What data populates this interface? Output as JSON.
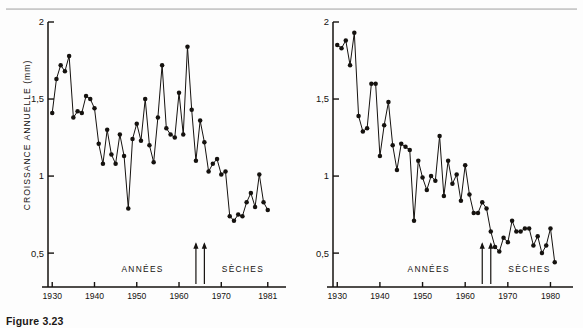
{
  "figure": {
    "caption": "Figure 3.23",
    "ylabel": "CROISSANCE ANNUELLE (mm)",
    "ink_color": "#15120f",
    "background": "#fdfdfd"
  },
  "chart_data": [
    {
      "type": "line",
      "panel": "left",
      "title": "",
      "xlabel": "",
      "ylabel": "CROISSANCE ANNUELLE (mm)",
      "xlim": [
        1929,
        1982
      ],
      "ylim": [
        0.28,
        2.0
      ],
      "grid": false,
      "legend": null,
      "ytick_values": [
        2,
        1.5,
        1,
        0.5
      ],
      "ytick_labels": [
        "2",
        "1,5",
        "1",
        "0,5"
      ],
      "xtick_values": [
        1930,
        1940,
        1950,
        1960,
        1970,
        1981
      ],
      "xtick_labels": [
        "19|30",
        "1940",
        "1950",
        "1960",
        "1970",
        "1981"
      ],
      "marker": "filled-circle",
      "annotations": [
        {
          "text": "ANNÉES",
          "x": 1958.5,
          "y": 0.4
        },
        {
          "text": "SÈCHES",
          "x": 1968.0,
          "y": 0.4
        },
        {
          "text": "arrow-up",
          "x": 1964.0,
          "y_from": 0.3,
          "y_to": 0.56
        },
        {
          "text": "arrow-up",
          "x": 1966.0,
          "y_from": 0.3,
          "y_to": 0.56
        }
      ],
      "x": [
        1930,
        1931,
        1932,
        1933,
        1934,
        1935,
        1936,
        1937,
        1938,
        1939,
        1940,
        1941,
        1942,
        1943,
        1944,
        1945,
        1946,
        1947,
        1948,
        1949,
        1950,
        1951,
        1952,
        1953,
        1954,
        1955,
        1956,
        1957,
        1958,
        1959,
        1960,
        1961,
        1962,
        1963,
        1964,
        1965,
        1966,
        1967,
        1968,
        1969,
        1970,
        1971,
        1972,
        1973,
        1974,
        1975,
        1976,
        1977,
        1978,
        1979,
        1980,
        1981
      ],
      "values": [
        1.41,
        1.63,
        1.72,
        1.68,
        1.78,
        1.38,
        1.42,
        1.41,
        1.52,
        1.5,
        1.44,
        1.21,
        1.08,
        1.3,
        1.14,
        1.08,
        1.27,
        1.13,
        0.79,
        1.24,
        1.34,
        1.23,
        1.5,
        1.2,
        1.09,
        1.38,
        1.72,
        1.31,
        1.27,
        1.25,
        1.54,
        1.27,
        1.84,
        1.43,
        1.1,
        1.36,
        1.22,
        1.03,
        1.08,
        1.11,
        1.01,
        1.03,
        0.74,
        0.71,
        0.75,
        0.74,
        0.83,
        0.89,
        0.8,
        1.01,
        0.83,
        0.78
      ]
    },
    {
      "type": "line",
      "panel": "right",
      "title": "",
      "xlabel": "",
      "ylabel": "",
      "xlim": [
        1929,
        1982
      ],
      "ylim": [
        0.28,
        2.0
      ],
      "grid": false,
      "legend": null,
      "ytick_values": [
        2,
        1.5,
        1,
        0.5
      ],
      "ytick_labels": [
        "2",
        "1,5",
        "1",
        "0,5"
      ],
      "xtick_values": [
        1930,
        1940,
        1950,
        1960,
        1970,
        1980
      ],
      "xtick_labels": [
        "19|30",
        "1940",
        "1950",
        "1960",
        "1970",
        "1980"
      ],
      "marker": "filled-circle",
      "annotations": [
        {
          "text": "ANNÉES",
          "x": 1958.5,
          "y": 0.4
        },
        {
          "text": "SÈCHES",
          "x": 1968.0,
          "y": 0.4
        },
        {
          "text": "arrow-up",
          "x": 1964.0,
          "y_from": 0.3,
          "y_to": 0.56
        },
        {
          "text": "arrow-up",
          "x": 1966.0,
          "y_from": 0.3,
          "y_to": 0.56
        }
      ],
      "x": [
        1930,
        1931,
        1932,
        1933,
        1934,
        1935,
        1936,
        1937,
        1938,
        1939,
        1940,
        1941,
        1942,
        1943,
        1944,
        1945,
        1946,
        1947,
        1948,
        1949,
        1950,
        1951,
        1952,
        1953,
        1954,
        1955,
        1956,
        1957,
        1958,
        1959,
        1960,
        1961,
        1962,
        1963,
        1964,
        1965,
        1966,
        1967,
        1968,
        1969,
        1970,
        1971,
        1972,
        1973,
        1974,
        1975,
        1976,
        1977,
        1978,
        1979,
        1980,
        1981
      ],
      "values": [
        1.85,
        1.83,
        1.88,
        1.72,
        1.93,
        1.39,
        1.29,
        1.31,
        1.6,
        1.6,
        1.13,
        1.33,
        1.48,
        1.2,
        1.04,
        1.21,
        1.19,
        1.17,
        0.71,
        1.1,
        0.99,
        0.91,
        1.0,
        0.97,
        1.26,
        0.87,
        1.1,
        0.95,
        1.01,
        0.84,
        1.07,
        0.88,
        0.76,
        0.76,
        0.83,
        0.79,
        0.64,
        0.54,
        0.51,
        0.6,
        0.57,
        0.71,
        0.64,
        0.64,
        0.66,
        0.66,
        0.55,
        0.61,
        0.5,
        0.55,
        0.66,
        0.44
      ]
    }
  ]
}
